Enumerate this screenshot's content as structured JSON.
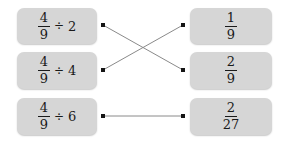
{
  "canvas": {
    "width": 289,
    "height": 146,
    "background": "#ffffff"
  },
  "style": {
    "box_fill": "#d6d6d6",
    "text_color": "#1a1a1a",
    "line_color": "#8a8a8a",
    "dot_color": "#151515"
  },
  "activity": {
    "type": "matching-exercise",
    "left_column": [
      {
        "id": "left-1",
        "text": "4/9 ÷ 2",
        "fraction": {
          "numerator": "4",
          "denominator": "9"
        },
        "operator": "÷",
        "operand": "2"
      },
      {
        "id": "left-2",
        "text": "4/9 ÷ 4",
        "fraction": {
          "numerator": "4",
          "denominator": "9"
        },
        "operator": "÷",
        "operand": "4"
      },
      {
        "id": "left-3",
        "text": "4/9 ÷ 6",
        "fraction": {
          "numerator": "4",
          "denominator": "9"
        },
        "operator": "÷",
        "operand": "6"
      }
    ],
    "right_column": [
      {
        "id": "right-1",
        "text": "1/9",
        "fraction": {
          "numerator": "1",
          "denominator": "9"
        }
      },
      {
        "id": "right-2",
        "text": "2/9",
        "fraction": {
          "numerator": "2",
          "denominator": "9"
        }
      },
      {
        "id": "right-3",
        "text": "2/27",
        "fraction": {
          "numerator": "2",
          "denominator": "27"
        }
      }
    ],
    "connections": [
      {
        "from": "left-1",
        "to": "right-2",
        "x1": 103,
        "y1": 25,
        "x2": 183,
        "y2": 70
      },
      {
        "from": "left-2",
        "to": "right-1",
        "x1": 103,
        "y1": 70,
        "x2": 183,
        "y2": 25
      },
      {
        "from": "left-3",
        "to": "right-3",
        "x1": 103,
        "y1": 116,
        "x2": 183,
        "y2": 116
      }
    ],
    "dots": [
      {
        "id": "dot-left-1",
        "x": 103,
        "y": 25
      },
      {
        "id": "dot-left-2",
        "x": 103,
        "y": 70
      },
      {
        "id": "dot-left-3",
        "x": 103,
        "y": 116
      },
      {
        "id": "dot-right-1",
        "x": 183,
        "y": 25
      },
      {
        "id": "dot-right-2",
        "x": 183,
        "y": 70
      },
      {
        "id": "dot-right-3",
        "x": 183,
        "y": 116
      }
    ]
  }
}
